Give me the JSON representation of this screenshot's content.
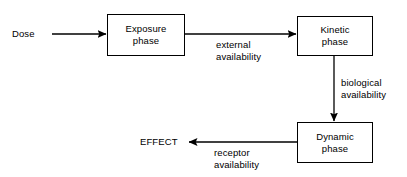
{
  "diagram": {
    "background_color": "#ffffff",
    "stroke_color": "#000000",
    "text_color": "#000000",
    "nodes": [
      {
        "id": "exposure",
        "line1": "Exposure",
        "line2": "phase",
        "shape": "rectangle"
      },
      {
        "id": "kinetic",
        "line1": "Kinetic",
        "line2": "phase",
        "shape": "rectangle"
      },
      {
        "id": "dynamic",
        "line1": "Dynamic",
        "line2": "phase",
        "shape": "rectangle"
      }
    ],
    "terminals": [
      {
        "id": "dose",
        "label": "Dose"
      },
      {
        "id": "effect",
        "label": "EFFECT"
      }
    ],
    "edges": [
      {
        "id": "dose-to-exposure",
        "from": "dose",
        "to": "exposure",
        "label_line1": "",
        "label_line2": "",
        "direction": "right"
      },
      {
        "id": "exposure-to-kinetic",
        "from": "exposure",
        "to": "kinetic",
        "label_line1": "external",
        "label_line2": "availability",
        "direction": "right"
      },
      {
        "id": "kinetic-to-dynamic",
        "from": "kinetic",
        "to": "dynamic",
        "label_line1": "biological",
        "label_line2": "availability",
        "direction": "down"
      },
      {
        "id": "dynamic-to-effect",
        "from": "dynamic",
        "to": "effect",
        "label_line1": "receptor",
        "label_line2": "availability",
        "direction": "left"
      }
    ]
  }
}
